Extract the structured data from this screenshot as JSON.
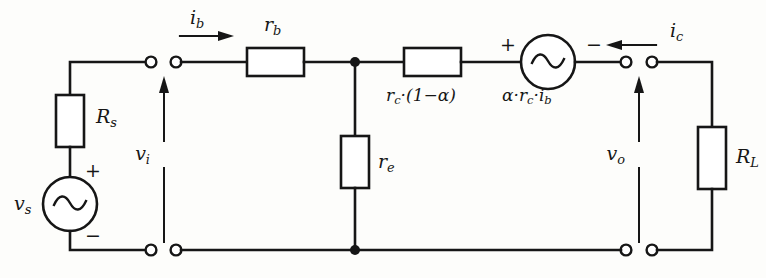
{
  "diagram": {
    "stroke_color": "#161616",
    "background_color": "#fdfdfb"
  },
  "labels": {
    "source_resistance": "R",
    "source_resistance_sub": "s",
    "source_voltage": "v",
    "source_voltage_sub": "s",
    "input_voltage": "v",
    "input_voltage_sub": "i",
    "base_current": "i",
    "base_current_sub": "b",
    "base_resistance": "r",
    "base_resistance_sub": "b",
    "emitter_resistance": "r",
    "emitter_resistance_sub": "e",
    "collector_resistance": "r",
    "collector_resistance_sub": "c",
    "collector_resistance_expr": "·(1−α)",
    "dependent_source_alpha": "α",
    "dependent_source_expr_1": "·r",
    "dependent_source_expr_1_sub": "c",
    "dependent_source_expr_2": "·i",
    "dependent_source_expr_2_sub": "b",
    "collector_current": "i",
    "collector_current_sub": "c",
    "output_voltage": "v",
    "output_voltage_sub": "o",
    "load_resistance": "R",
    "load_resistance_sub": "L",
    "plus_sign": "+",
    "minus_sign": "−"
  },
  "components": [
    {
      "name": "source-resistor",
      "type": "resistor",
      "orientation": "vertical",
      "label": "Rs"
    },
    {
      "name": "source-ac-voltage",
      "type": "ac-source",
      "orientation": "vertical",
      "label": "vs",
      "polarity_top": "+",
      "polarity_bottom": "−"
    },
    {
      "name": "base-resistor",
      "type": "resistor",
      "orientation": "horizontal",
      "label": "rb"
    },
    {
      "name": "emitter-resistor",
      "type": "resistor",
      "orientation": "vertical",
      "label": "re"
    },
    {
      "name": "collector-resistor",
      "type": "resistor",
      "orientation": "horizontal",
      "label": "rc·(1−α)"
    },
    {
      "name": "dependent-ac-source",
      "type": "ac-source",
      "orientation": "horizontal",
      "label": "α·rc·ib",
      "polarity_left": "+",
      "polarity_right": "−"
    },
    {
      "name": "load-resistor",
      "type": "resistor",
      "orientation": "vertical",
      "label": "RL"
    }
  ],
  "annotations": [
    {
      "name": "base-current-arrow",
      "direction": "right",
      "label": "ib"
    },
    {
      "name": "collector-current-arrow",
      "direction": "left",
      "label": "ic"
    },
    {
      "name": "input-voltage-arrow",
      "direction": "up",
      "label": "vi"
    },
    {
      "name": "output-voltage-arrow",
      "direction": "up",
      "label": "vo"
    }
  ],
  "terminals": [
    {
      "name": "input-terminal-top-left"
    },
    {
      "name": "input-terminal-top-right"
    },
    {
      "name": "input-terminal-bottom-left"
    },
    {
      "name": "input-terminal-bottom-right"
    },
    {
      "name": "output-terminal-top-left"
    },
    {
      "name": "output-terminal-top-right"
    },
    {
      "name": "output-terminal-bottom-left"
    },
    {
      "name": "output-terminal-bottom-right"
    }
  ],
  "junctions": [
    {
      "name": "base-emitter-node-top"
    },
    {
      "name": "emitter-node-bottom"
    }
  ]
}
